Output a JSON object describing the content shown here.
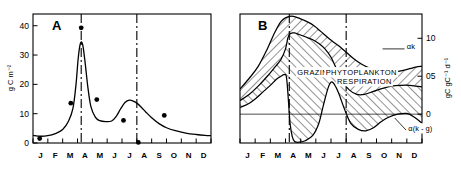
{
  "figure": {
    "background": "#ffffff",
    "ink": "#000000"
  },
  "chart_data": [
    {
      "type": "line",
      "panel": "A",
      "panel_label": "A",
      "title": "",
      "xlabel": "",
      "ylabel": "g C m⁻²",
      "ylim": [
        0,
        44
      ],
      "yticks": [
        0,
        10,
        20,
        30,
        40
      ],
      "ytick_labels": [
        "0",
        "10",
        "20",
        "30",
        "40"
      ],
      "xlim": [
        0,
        12
      ],
      "categories": [
        "J",
        "F",
        "M",
        "A",
        "M",
        "J",
        "J",
        "A",
        "S",
        "O",
        "N",
        "D"
      ],
      "grid": false,
      "legend": "none",
      "series": [
        {
          "name": "phytoplankton biomass curve",
          "style": "solid-line",
          "x": [
            0.0,
            0.5,
            1.0,
            1.5,
            2.0,
            2.4,
            2.7,
            2.9,
            3.05,
            3.2,
            3.35,
            3.5,
            3.7,
            3.9,
            4.2,
            4.5,
            4.9,
            5.3,
            5.6,
            5.9,
            6.2,
            6.5,
            6.8,
            7.0,
            7.3,
            7.6,
            8.0,
            8.5,
            9.0,
            9.6,
            10.3,
            11.0,
            11.6,
            12.0
          ],
          "y": [
            2.6,
            2.3,
            2.5,
            3.2,
            4.6,
            7.5,
            12.0,
            20.0,
            29.0,
            34.0,
            33.5,
            28.0,
            19.0,
            12.5,
            8.8,
            7.6,
            7.3,
            7.5,
            9.0,
            11.6,
            13.8,
            14.6,
            14.2,
            13.6,
            12.2,
            10.6,
            8.6,
            6.6,
            5.2,
            4.2,
            3.4,
            2.9,
            2.6,
            2.5
          ]
        },
        {
          "name": "observed data points",
          "style": "filled-circles",
          "x": [
            0.45,
            2.55,
            3.25,
            4.3,
            6.1,
            7.1,
            8.85
          ],
          "y": [
            1.5,
            13.6,
            39.3,
            14.8,
            7.7,
            0.2,
            9.4
          ]
        }
      ],
      "vertical_reference_lines": {
        "style": "dash-dot",
        "x": [
          3.25,
          7.0
        ]
      }
    },
    {
      "type": "area",
      "panel": "B",
      "panel_label": "B",
      "title": "",
      "xlabel": "",
      "ylabel": "gC gC⁻¹ d⁻¹",
      "ylabel_side": "right",
      "ylim": [
        -0.38,
        1.32
      ],
      "yticks": [
        0,
        0.5,
        1.0
      ],
      "ytick_labels": [
        "0",
        "05",
        "10"
      ],
      "xlim": [
        0,
        12
      ],
      "categories": [
        "J",
        "F",
        "M",
        "A",
        "M",
        "J",
        "J",
        "A",
        "S",
        "O",
        "N",
        "D"
      ],
      "grid": false,
      "zero_line": true,
      "legend": "annotations",
      "series": [
        {
          "name": "alpha k",
          "label": "αk",
          "style": "solid-line-upper",
          "x": [
            0.0,
            0.6,
            1.2,
            1.8,
            2.3,
            2.7,
            3.0,
            3.3,
            3.7,
            4.2,
            4.7,
            5.1,
            5.5,
            5.9,
            6.3,
            6.7,
            7.1,
            7.5,
            8.0,
            8.5,
            9.0,
            9.5,
            10.0,
            10.6,
            11.2,
            11.6,
            12.0
          ],
          "y": [
            0.33,
            0.47,
            0.63,
            0.86,
            1.08,
            1.22,
            1.27,
            1.29,
            1.28,
            1.24,
            1.19,
            1.13,
            1.06,
            0.99,
            0.93,
            0.87,
            0.8,
            0.73,
            0.66,
            0.61,
            0.57,
            0.55,
            0.55,
            0.57,
            0.6,
            0.62,
            0.63
          ]
        },
        {
          "name": "net production boundary",
          "label": "",
          "style": "solid-line-middle",
          "x": [
            0.0,
            0.6,
            1.2,
            1.8,
            2.3,
            2.7,
            3.0,
            3.15,
            3.3,
            3.45,
            3.6,
            3.9,
            4.3,
            4.8,
            5.2,
            5.6,
            6.0,
            6.4,
            6.8,
            7.2,
            7.7,
            8.2,
            8.8,
            9.4,
            10.0,
            10.6,
            11.2,
            11.6,
            12.0
          ],
          "y": [
            0.18,
            0.26,
            0.37,
            0.5,
            0.62,
            0.72,
            0.86,
            1.0,
            1.06,
            1.07,
            1.07,
            1.05,
            1.02,
            0.98,
            0.93,
            0.86,
            0.75,
            0.58,
            0.42,
            0.32,
            0.26,
            0.26,
            0.3,
            0.34,
            0.37,
            0.38,
            0.38,
            0.37,
            0.36
          ]
        },
        {
          "name": "alpha (k minus g)",
          "label": "α(k - g)",
          "style": "solid-line-lower",
          "x": [
            0.0,
            0.5,
            1.0,
            1.5,
            2.0,
            2.4,
            2.7,
            2.9,
            3.05,
            3.15,
            3.3,
            3.45,
            3.6,
            3.9,
            4.3,
            4.8,
            5.2,
            5.5,
            5.8,
            6.0,
            6.2,
            6.5,
            6.9,
            7.3,
            7.8,
            8.3,
            8.8,
            9.3,
            9.8,
            10.4,
            11.0,
            11.5,
            12.0
          ],
          "y": [
            0.09,
            0.13,
            0.2,
            0.29,
            0.38,
            0.46,
            0.5,
            0.52,
            0.5,
            0.3,
            -0.12,
            -0.3,
            -0.36,
            -0.37,
            -0.35,
            -0.28,
            -0.12,
            0.12,
            0.34,
            0.42,
            0.4,
            0.28,
            0.06,
            -0.12,
            -0.2,
            -0.22,
            -0.18,
            -0.1,
            -0.04,
            0.0,
            0.01,
            -0.04,
            -0.12
          ]
        }
      ],
      "annotations": [
        {
          "text": "GRAZING",
          "x": 5.0,
          "y": 0.52
        },
        {
          "text": "PHYTOPLANKTON",
          "x": 8.0,
          "y": 0.52
        },
        {
          "text": "RESPIRATION",
          "x": 8.2,
          "y": 0.4
        },
        {
          "text": "αk",
          "x": 11.0,
          "y": 0.86
        },
        {
          "text": "α(k - g)",
          "x": 11.1,
          "y": -0.22
        }
      ],
      "vertical_reference_lines": {
        "style": "dash-dot",
        "x": [
          3.25,
          7.0
        ]
      }
    }
  ]
}
